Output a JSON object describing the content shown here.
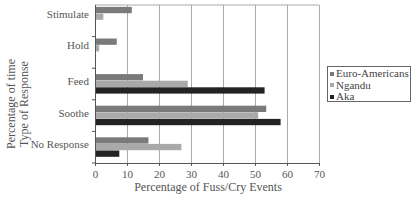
{
  "chart_data": {
    "type": "bar",
    "orientation": "horizontal",
    "title": "",
    "xlabel": "Percentage of Fuss/Cry Events",
    "ylabel_lines": [
      "Percentage of time",
      "Type of Response"
    ],
    "categories": [
      "Stimulate",
      "Hold",
      "Feed",
      "Soothe",
      "No Response"
    ],
    "xlim": [
      0,
      70
    ],
    "xticks": [
      "0",
      "10",
      "20",
      "30",
      "40",
      "50",
      "60",
      "70"
    ],
    "grid": true,
    "legend_position": "right",
    "series": [
      {
        "name": "Euro-Americans",
        "color": "#7a7a7a",
        "values": [
          11.5,
          6.8,
          15,
          53.5,
          16.7
        ]
      },
      {
        "name": "Ngandu",
        "color": "#a9a9a9",
        "values": [
          2.6,
          1.3,
          29,
          51,
          27
        ]
      },
      {
        "name": "Aka",
        "color": "#232323",
        "values": [
          0,
          0,
          53,
          58,
          7.6
        ]
      }
    ]
  }
}
